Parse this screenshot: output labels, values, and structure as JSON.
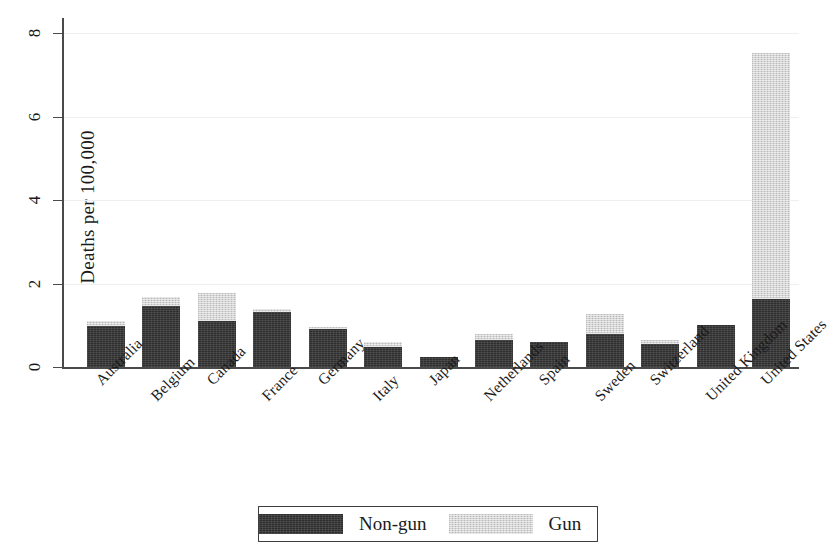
{
  "chart_data": {
    "type": "bar",
    "subtype": "stacked-vertical",
    "title": "",
    "xlabel": "",
    "ylabel": "Deaths per 100,000",
    "ylim": [
      0,
      8.2
    ],
    "yticks": [
      0,
      2,
      4,
      6,
      8
    ],
    "ytick_labels": [
      "0",
      "2",
      "4",
      "6",
      "8"
    ],
    "grid": "horizontal-faint",
    "legend_position": "bottom-center",
    "categories": [
      "Australia",
      "Belgium",
      "Canada",
      "France",
      "Germany",
      "Italy",
      "Japan",
      "Netherlands",
      "Spain",
      "Sweden",
      "Switzerland",
      "United Kingdom",
      "United States"
    ],
    "series": [
      {
        "name": "Non-gun",
        "color": "#2e2e2e",
        "values": [
          0.98,
          1.47,
          1.1,
          1.31,
          0.91,
          0.47,
          0.23,
          0.65,
          0.61,
          0.79,
          0.56,
          1.0,
          1.63
        ]
      },
      {
        "name": "Gun",
        "color": "#d4d4d4",
        "values": [
          0.12,
          0.21,
          0.67,
          0.07,
          0.02,
          0.14,
          0.0,
          0.14,
          0.0,
          0.49,
          0.09,
          0.0,
          5.9
        ]
      }
    ],
    "totals": [
      1.1,
      1.68,
      1.77,
      1.38,
      0.93,
      0.61,
      0.23,
      0.79,
      0.61,
      1.28,
      0.65,
      1.0,
      7.53
    ]
  },
  "legend": {
    "entries": [
      {
        "label": "Non-gun",
        "swatch": "dark"
      },
      {
        "label": "Gun",
        "swatch": "light"
      }
    ]
  },
  "axis": {
    "y_title": "Deaths per 100,000"
  }
}
